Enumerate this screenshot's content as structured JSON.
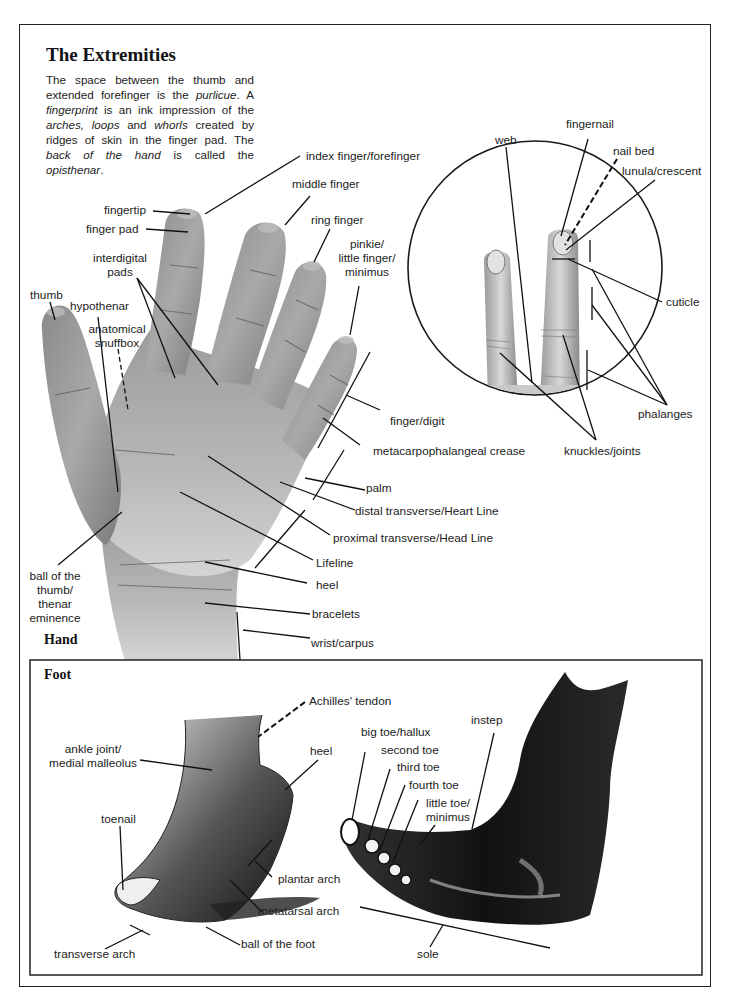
{
  "title": "The Extremities",
  "intro": {
    "parts": [
      {
        "text": "The space between the thumb and extended forefinger is the ",
        "italic": false
      },
      {
        "text": "purlicue",
        "italic": true
      },
      {
        "text": ". A ",
        "italic": false
      },
      {
        "text": "fingerprint",
        "italic": true
      },
      {
        "text": " is an ink impression of the ",
        "italic": false
      },
      {
        "text": "arches, loops",
        "italic": true
      },
      {
        "text": " and ",
        "italic": false
      },
      {
        "text": "whorls",
        "italic": true
      },
      {
        "text": " created by ridges of skin in the finger pad. The ",
        "italic": false
      },
      {
        "text": "back of the hand",
        "italic": true
      },
      {
        "text": " is called the ",
        "italic": false
      },
      {
        "text": "opisthenar",
        "italic": true
      },
      {
        "text": ".",
        "italic": false
      }
    ]
  },
  "hand": {
    "section_label": "Hand",
    "labels": {
      "index_finger": "index finger/forefinger",
      "middle_finger": "middle finger",
      "ring_finger": "ring finger",
      "pinkie_1": "pinkie/",
      "pinkie_2": "little finger/",
      "pinkie_3": "minimus",
      "fingertip": "fingertip",
      "finger_pad": "finger pad",
      "interdigital_1": "interdigital",
      "interdigital_2": "pads",
      "thumb": "thumb",
      "hypothenar": "hypothenar",
      "snuffbox_1": "anatomical",
      "snuffbox_2": "snuffbox",
      "finger_digit": "finger/digit",
      "mcp_crease": "metacarpophalangeal crease",
      "palm": "palm",
      "heart_line": "distal transverse/Heart Line",
      "head_line": "proximal transverse/Head Line",
      "lifeline": "Lifeline",
      "heel": "heel",
      "bracelets": "bracelets",
      "wrist": "wrist/carpus",
      "thenar_1": "ball of the",
      "thenar_2": "thumb/",
      "thenar_3": "thenar",
      "thenar_4": "eminence"
    }
  },
  "finger_detail": {
    "labels": {
      "web": "web",
      "fingernail": "fingernail",
      "nail_bed": "nail bed",
      "lunula": "lunula/crescent",
      "cuticle": "cuticle",
      "phalanges": "phalanges",
      "knuckles": "knuckles/joints"
    }
  },
  "foot": {
    "section_label": "Foot",
    "labels": {
      "achilles": "Achilles' tendon",
      "ankle_1": "ankle joint/",
      "ankle_2": "medial malleolus",
      "heel": "heel",
      "toenail": "toenail",
      "plantar_arch": "plantar arch",
      "metatarsal_arch": "metatarsal arch",
      "transverse_arch": "transverse arch",
      "ball_of_foot": "ball of the foot",
      "big_toe": "big toe/hallux",
      "second_toe": "second toe",
      "third_toe": "third toe",
      "fourth_toe": "fourth toe",
      "little_toe_1": "little toe/",
      "little_toe_2": "minimus",
      "instep": "instep",
      "sole": "sole"
    }
  },
  "colors": {
    "ink": "#1a1a1a",
    "skin_dark": "#6e6e6e",
    "skin_mid": "#9a9a9a",
    "skin_light": "#c8c8c8",
    "paper": "#ffffff"
  }
}
